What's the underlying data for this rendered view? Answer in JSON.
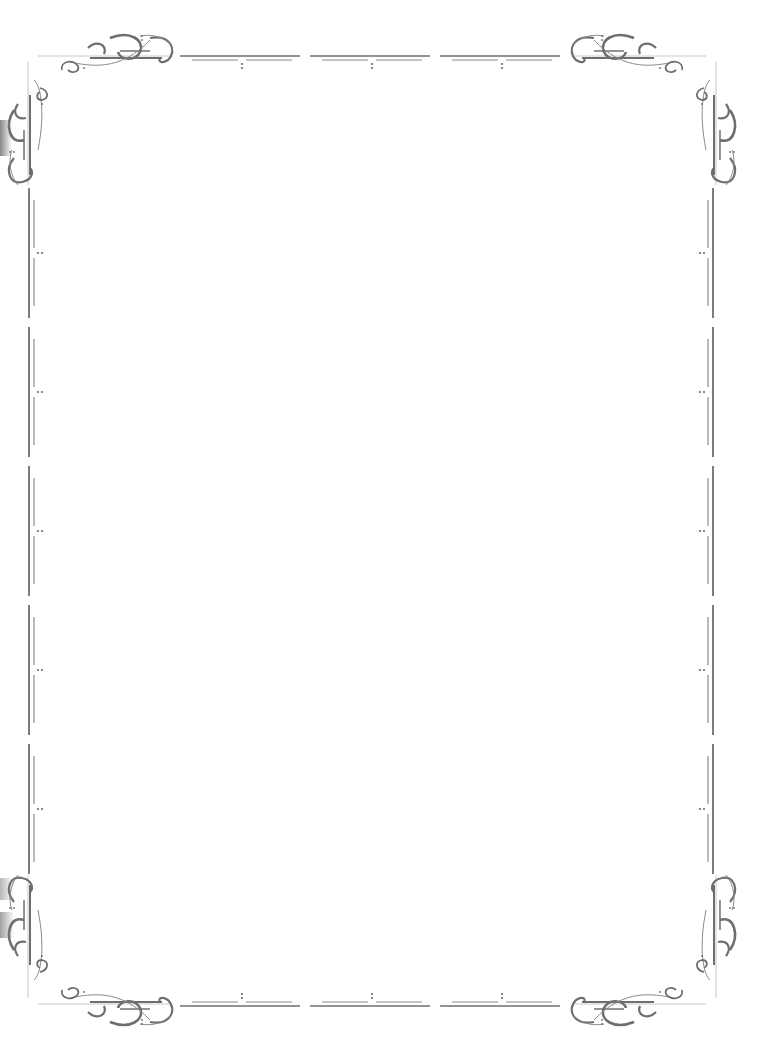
{
  "page": {
    "type": "decorative-border-frame",
    "background": "#ffffff",
    "content": ""
  },
  "border": {
    "color": "#6e6e6e",
    "light_color": "#a8a8a8",
    "style": "ornate-flourish-corners-with-dashed-rules",
    "corners": [
      "top-left-flourish-icon",
      "top-right-flourish-icon",
      "bottom-left-flourish-icon",
      "bottom-right-flourish-icon"
    ],
    "top_segments": 3,
    "bottom_segments": 3,
    "side_segments": 5,
    "side_dot_positions_y": [
      253,
      392,
      531,
      670,
      809
    ],
    "top_dot_positions_x": [
      240,
      371,
      500
    ]
  }
}
